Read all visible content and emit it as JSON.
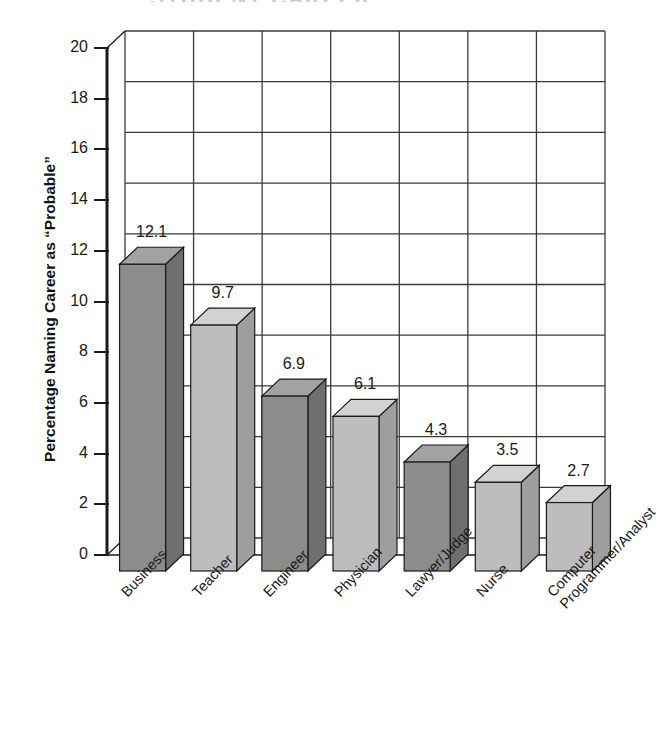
{
  "title_remnant": "STUDENT CAREER",
  "chart_data": {
    "type": "bar",
    "title": "",
    "xlabel": "",
    "ylabel": "Percentage Naming Career as “Probable”",
    "categories": [
      "Business",
      "Teacher",
      "Engineer",
      "Physician",
      "Lawyer/Judge",
      "Nurse",
      "Computer\nProgrammer/Analyst"
    ],
    "values": [
      12.1,
      9.7,
      6.9,
      6.1,
      4.3,
      3.5,
      2.7
    ],
    "value_labels": [
      "12.1",
      "9.7",
      "6.9",
      "6.1",
      "4.3",
      "3.5",
      "2.7"
    ],
    "ylim": [
      0,
      20
    ],
    "ytick_values": [
      20,
      18,
      16,
      14,
      12,
      10,
      8,
      6,
      4,
      2,
      0
    ],
    "ytick_labels": [
      "20",
      "18",
      "16",
      "14",
      "12",
      "10",
      "8",
      "6",
      "4",
      "2",
      "0"
    ],
    "grid": true,
    "legend": "none",
    "bar_style": "3d",
    "bar_colors": [
      "#8c8c8c",
      "#bdbdbd",
      "#8c8c8c",
      "#bdbdbd",
      "#8c8c8c",
      "#bdbdbd",
      "#bdbdbd"
    ],
    "colors": {
      "bar_dark": "#8c8c8c",
      "bar_light": "#bdbdbd",
      "bar_dark_top": "#a2a2a2",
      "bar_light_top": "#d2d2d2",
      "bar_dark_side": "#6f6f6f",
      "bar_light_side": "#9e9e9e",
      "axis": "#1a1a1a",
      "grid": "#3a3a3a",
      "background": "#ffffff",
      "text": "#1a1a1a"
    }
  }
}
